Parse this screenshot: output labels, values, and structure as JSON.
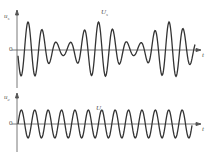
{
  "chart_data": [
    {
      "type": "line",
      "title": "",
      "ylabel": "u_s",
      "xlabel": "t",
      "curve_label": "u_s",
      "zero_label": "0",
      "description": "Beat waveform: amplitude decays to a minimum, then grows again (two periods of beat envelope visible)",
      "peaks": [
        {
          "x": 28,
          "amp": 1.0
        },
        {
          "x": 42,
          "amp": 0.85
        },
        {
          "x": 55,
          "amp": 0.65
        },
        {
          "x": 70,
          "amp": 0.4
        },
        {
          "x": 84,
          "amp": 0.2
        },
        {
          "x": 99,
          "amp": 1.0
        },
        {
          "x": 113,
          "amp": 0.85
        },
        {
          "x": 127,
          "amp": 0.6
        },
        {
          "x": 141,
          "amp": 0.3
        },
        {
          "x": 155,
          "amp": 0.2
        },
        {
          "x": 170,
          "amp": 1.0
        },
        {
          "x": 184,
          "amp": 0.9
        }
      ],
      "grid": false
    },
    {
      "type": "line",
      "title": "",
      "ylabel": "u_c",
      "xlabel": "t",
      "curve_label": "u_c",
      "zero_label": "0",
      "description": "Constant-amplitude sinusoid (carrier)",
      "cycles": 13,
      "amplitude": 1.0,
      "grid": false
    }
  ],
  "labels": {
    "top_ylabel": "u",
    "top_ysub": "s",
    "top_zero": "0",
    "top_curve": "U",
    "top_curve_sub": "s",
    "top_t": "t",
    "bottom_ylabel": "u",
    "bottom_ysub": "c",
    "bottom_zero": "0",
    "bottom_curve": "U",
    "bottom_curve_sub": "c",
    "bottom_t": "t"
  }
}
